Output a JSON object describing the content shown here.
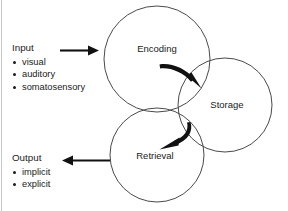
{
  "diagram": {
    "background_color": "#ffffff",
    "outline_color": "#4a4a4a",
    "arrow_color": "#111111",
    "text_color": "#1b1b1b",
    "nodes": [
      {
        "id": "encoding",
        "label": "Encoding",
        "cx": 157,
        "cy": 59,
        "r": 53
      },
      {
        "id": "storage",
        "label": "Storage",
        "cx": 225,
        "cy": 105,
        "r": 47
      },
      {
        "id": "retrieval",
        "label": "Retrieval",
        "cx": 157,
        "cy": 155,
        "r": 47
      }
    ],
    "input": {
      "heading": "Input",
      "items": [
        "visual",
        "auditory",
        "somatosensory"
      ],
      "arrow_direction": "right"
    },
    "output": {
      "heading": "Output",
      "items": [
        "implicit",
        "explicit"
      ],
      "arrow_direction": "left"
    },
    "flow_arrows": [
      {
        "id": "encoding-to-storage",
        "from": "encoding",
        "to": "storage",
        "style": "curved"
      },
      {
        "id": "storage-to-retrieval",
        "from": "storage",
        "to": "retrieval",
        "style": "curved"
      }
    ]
  }
}
